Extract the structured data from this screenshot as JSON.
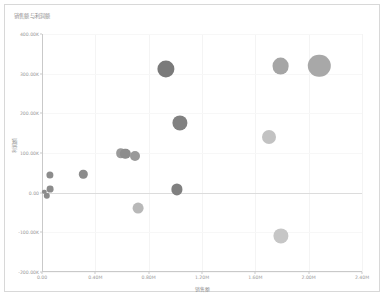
{
  "chart_data": {
    "type": "scatter",
    "title": "销售额与利润额",
    "xlabel": "销售额",
    "ylabel": "利润额",
    "xlim": [
      0,
      2400000
    ],
    "ylim": [
      -200000,
      400000
    ],
    "grid": true,
    "legend": "none",
    "zero_line": 0,
    "xticks": [
      {
        "value": 0,
        "label": "0.00"
      },
      {
        "value": 400000,
        "label": "0.40M"
      },
      {
        "value": 800000,
        "label": "0.80M"
      },
      {
        "value": 1200000,
        "label": "1.20M"
      },
      {
        "value": 1600000,
        "label": "1.60M"
      },
      {
        "value": 2000000,
        "label": "2.00M"
      },
      {
        "value": 2400000,
        "label": "2.40M"
      }
    ],
    "yticks": [
      {
        "value": 400000,
        "label": "400.00K"
      },
      {
        "value": 300000,
        "label": "300.00K"
      },
      {
        "value": 200000,
        "label": "200.00K"
      },
      {
        "value": 100000,
        "label": "100.00K"
      },
      {
        "value": 0,
        "label": "0.00"
      },
      {
        "value": -100000,
        "label": "-100.00K"
      },
      {
        "value": -200000,
        "label": "-200.00K"
      }
    ],
    "points": [
      {
        "x": 18000,
        "y": 2000,
        "size": 2.2,
        "color": "#8c8c8c"
      },
      {
        "x": 38000,
        "y": -8000,
        "size": 3.2,
        "color": "#8c8c8c"
      },
      {
        "x": 62000,
        "y": 8000,
        "size": 3.4,
        "color": "#8c8c8c"
      },
      {
        "x": 60000,
        "y": 44000,
        "size": 3.6,
        "color": "#8c8c8c"
      },
      {
        "x": 310000,
        "y": 46000,
        "size": 4.2,
        "color": "#8c8c8c"
      },
      {
        "x": 590000,
        "y": 100000,
        "size": 4.8,
        "color": "#9a9a9a"
      },
      {
        "x": 625000,
        "y": 98000,
        "size": 5.2,
        "color": "#8c8c8c"
      },
      {
        "x": 700000,
        "y": 93000,
        "size": 5.0,
        "color": "#9a9a9a"
      },
      {
        "x": 720000,
        "y": -38000,
        "size": 5.4,
        "color": "#b8b8b8"
      },
      {
        "x": 1010000,
        "y": 8000,
        "size": 5.6,
        "color": "#808080"
      },
      {
        "x": 1035000,
        "y": 175000,
        "size": 7.6,
        "color": "#818181"
      },
      {
        "x": 930000,
        "y": 312000,
        "size": 8.6,
        "color": "#7a7a7a"
      },
      {
        "x": 1700000,
        "y": 140000,
        "size": 7.0,
        "color": "#c2c2c2"
      },
      {
        "x": 1790000,
        "y": -108000,
        "size": 7.6,
        "color": "#c6c6c6"
      },
      {
        "x": 1790000,
        "y": 320000,
        "size": 8.4,
        "color": "#a5a5a5"
      },
      {
        "x": 2080000,
        "y": 320000,
        "size": 11.2,
        "color": "#a8a8a8"
      }
    ]
  }
}
